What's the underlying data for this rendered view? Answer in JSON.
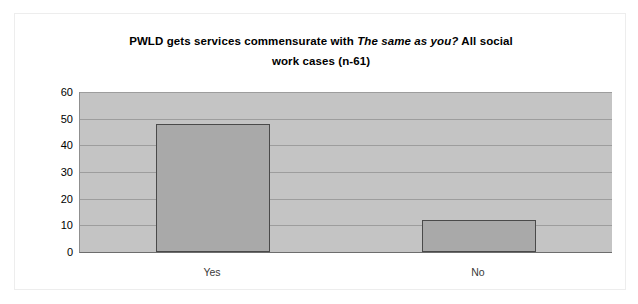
{
  "chart_data": {
    "type": "bar",
    "title_line1_pre": "PWLD gets services commensurate with ",
    "title_line1_italic": "The same as you?",
    "title_line1_post": "  All social",
    "title_line2": "work cases (n-61)",
    "title": "PWLD gets services commensurate with The same as you?  All social work cases (n-61)",
    "categories": [
      "Yes",
      "No"
    ],
    "values": [
      48,
      12
    ],
    "xlabel": "",
    "ylabel": "",
    "ylim": [
      0,
      60
    ],
    "ytick_step": 10,
    "yticks": [
      "0",
      "10",
      "20",
      "30",
      "40",
      "50",
      "60"
    ],
    "grid": true,
    "legend": false,
    "colors": {
      "bar_fill": "#a9a9a9",
      "bar_border": "#4a4a4a",
      "plot_background": "#c4c4c4",
      "gridline": "#9d9d9d",
      "frame_border": "#ededed",
      "page_background": "#ffffff",
      "text": "#000000"
    }
  }
}
